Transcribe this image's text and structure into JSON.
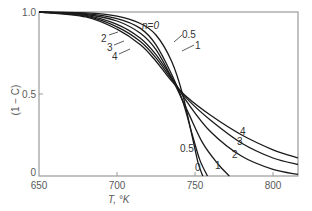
{
  "chart_data": {
    "type": "line",
    "title": "",
    "xlabel": "T, °K",
    "ylabel": "(1 − C)",
    "xlim": [
      650,
      816
    ],
    "ylim": [
      0,
      1.0
    ],
    "grid": false,
    "legend": "inline labels on curves",
    "x_ticks": [
      "650",
      "700",
      "750",
      "800"
    ],
    "y_ticks": [
      "0",
      "0.5",
      "1.0"
    ],
    "annotation": "n = 0",
    "series": [
      {
        "name": "0",
        "label": "n=0",
        "points": [
          [
            650,
            1.0
          ],
          [
            680,
            0.995
          ],
          [
            700,
            0.975
          ],
          [
            715,
            0.93
          ],
          [
            725,
            0.86
          ],
          [
            735,
            0.7
          ],
          [
            742,
            0.5
          ],
          [
            748,
            0.25
          ],
          [
            752,
            0.08
          ],
          [
            755,
            0.0
          ]
        ]
      },
      {
        "name": "0.5",
        "label": "0.5",
        "points": [
          [
            650,
            1.0
          ],
          [
            680,
            0.99
          ],
          [
            700,
            0.96
          ],
          [
            715,
            0.9
          ],
          [
            725,
            0.8
          ],
          [
            735,
            0.62
          ],
          [
            742,
            0.46
          ],
          [
            748,
            0.26
          ],
          [
            753,
            0.1
          ],
          [
            758,
            0.0
          ]
        ]
      },
      {
        "name": "1",
        "label": "1",
        "points": [
          [
            650,
            1.0
          ],
          [
            680,
            0.985
          ],
          [
            700,
            0.945
          ],
          [
            715,
            0.87
          ],
          [
            725,
            0.77
          ],
          [
            735,
            0.6
          ],
          [
            745,
            0.4
          ],
          [
            755,
            0.2
          ],
          [
            765,
            0.07
          ],
          [
            772,
            0.0
          ]
        ]
      },
      {
        "name": "2",
        "label": "2",
        "points": [
          [
            650,
            1.0
          ],
          [
            680,
            0.98
          ],
          [
            700,
            0.925
          ],
          [
            715,
            0.84
          ],
          [
            725,
            0.74
          ],
          [
            735,
            0.6
          ],
          [
            745,
            0.45
          ],
          [
            760,
            0.27
          ],
          [
            780,
            0.12
          ],
          [
            800,
            0.04
          ],
          [
            816,
            0.01
          ]
        ]
      },
      {
        "name": "3",
        "label": "3",
        "points": [
          [
            650,
            1.0
          ],
          [
            680,
            0.975
          ],
          [
            700,
            0.91
          ],
          [
            715,
            0.82
          ],
          [
            725,
            0.72
          ],
          [
            735,
            0.59
          ],
          [
            745,
            0.47
          ],
          [
            760,
            0.34
          ],
          [
            780,
            0.2
          ],
          [
            800,
            0.11
          ],
          [
            816,
            0.07
          ]
        ]
      },
      {
        "name": "4",
        "label": "4",
        "points": [
          [
            650,
            1.0
          ],
          [
            680,
            0.97
          ],
          [
            700,
            0.895
          ],
          [
            715,
            0.8
          ],
          [
            725,
            0.7
          ],
          [
            735,
            0.58
          ],
          [
            745,
            0.48
          ],
          [
            760,
            0.37
          ],
          [
            780,
            0.25
          ],
          [
            800,
            0.16
          ],
          [
            816,
            0.11
          ]
        ]
      }
    ]
  },
  "labels": {
    "y_tick_top": "1.0",
    "y_tick_mid": "0.5",
    "y_tick_bottom": "0",
    "x_tick_650": "650",
    "x_tick_700": "700",
    "x_tick_750": "750",
    "x_tick_800": "800",
    "x_axis_title": "T, °K",
    "y_axis_title": "(1 − C)",
    "curve_n0": "n=0",
    "curve_05_top": "0.5",
    "curve_1_top": "1",
    "curve_2_left": "2",
    "curve_3_left": "3",
    "curve_4_left": "4",
    "curve_05_bottom": "0.5",
    "curve_0_bottom": "0",
    "curve_1_bottom": "1",
    "curve_2_right": "2",
    "curve_3_right": "3",
    "curve_4_right": "4"
  }
}
